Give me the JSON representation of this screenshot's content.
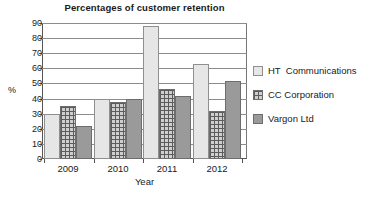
{
  "chart_data": {
    "type": "bar",
    "title": "Percentages of customer retention",
    "xlabel": "Year",
    "ylabel": "%",
    "categories": [
      "2009",
      "2010",
      "2011",
      "2012"
    ],
    "ylim": [
      0,
      90
    ],
    "yticks": [
      0,
      10,
      20,
      30,
      40,
      50,
      60,
      70,
      80,
      90
    ],
    "grid": true,
    "legend_position": "right",
    "series": [
      {
        "name": "HT  Communications",
        "color": "#e6e6e6",
        "values": [
          30,
          40,
          88,
          63
        ]
      },
      {
        "name": "CC Corporation",
        "color": "#cfcfcf",
        "values": [
          35,
          38,
          46,
          32
        ]
      },
      {
        "name": "Vargon Ltd",
        "color": "#9a9a9a",
        "values": [
          22,
          40,
          42,
          51.5
        ]
      }
    ]
  }
}
